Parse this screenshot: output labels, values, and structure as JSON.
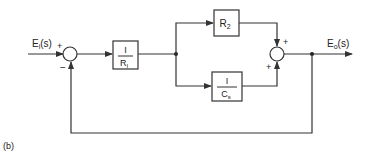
{
  "figure_label": "(b)",
  "input": {
    "main": "E",
    "sub": "i",
    "arg": "(s)"
  },
  "output": {
    "main": "E",
    "sub": "o",
    "arg": "(s)"
  },
  "summing_junction_1": {
    "plus": "+",
    "minus": "−"
  },
  "summing_junction_2": {
    "plus_top": "+",
    "plus_bottom": "+"
  },
  "block_1": {
    "numerator": "I",
    "den_main": "R",
    "den_sub": "I"
  },
  "block_r2": {
    "main": "R",
    "sub": "2"
  },
  "block_cs": {
    "numerator": "I",
    "den_main": "C",
    "den_sub": "s"
  }
}
